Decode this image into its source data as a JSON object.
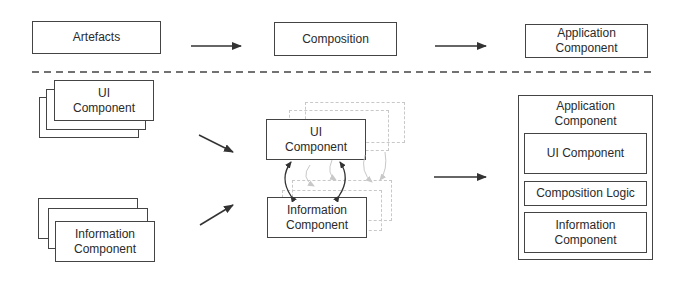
{
  "top_row": {
    "artefacts": "Artefacts",
    "composition": "Composition",
    "application_component": "Application Component"
  },
  "left": {
    "ui_component": "UI Component",
    "information_component": "Information Component"
  },
  "middle": {
    "ui_component": "UI Component",
    "information_component": "Information Component"
  },
  "right": {
    "title": "Application Component",
    "ui_component": "UI Component",
    "composition_logic": "Composition Logic",
    "information_component": "Information Component"
  },
  "colors": {
    "stroke": "#444444",
    "ghost": "#c8c8c8",
    "text": "#2a2a2a"
  }
}
